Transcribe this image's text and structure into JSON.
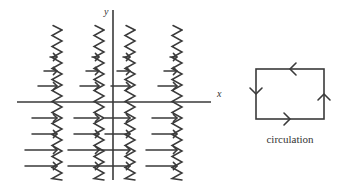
{
  "figure": {
    "title": "",
    "background_color": "#ffffff",
    "stroke_color": "#3a3a3a",
    "text_color": "#333333"
  },
  "axes": {
    "x_label": "x",
    "y_label": "y",
    "x_axis": {
      "x1": 17,
      "y1": 102,
      "x2": 211,
      "y2": 102
    },
    "y_axis": {
      "x1": 113,
      "y1": 10,
      "x2": 113,
      "y2": 180
    },
    "x_label_pos": {
      "x": 217,
      "y": 97
    },
    "y_label_pos": {
      "x": 104,
      "y": 15
    }
  },
  "wave_field": {
    "description": "vertical wavy (zigzag) magnetic field lines crossed by horizontal arrow lines",
    "wave_amplitude": 5,
    "wave_period": 11,
    "wave_lines": [
      {
        "x": 57,
        "y_top": 30,
        "y_bottom": 180
      },
      {
        "x": 99,
        "y_top": 30,
        "y_bottom": 180
      },
      {
        "x": 130,
        "y_top": 30,
        "y_bottom": 180
      },
      {
        "x": 177,
        "y_top": 30,
        "y_bottom": 180
      }
    ],
    "arrow_rows_upper": [
      {
        "y": 57,
        "segments": [
          {
            "x1": 50,
            "x2": 57
          },
          {
            "x1": 92,
            "x2": 99
          },
          {
            "x1": 123,
            "x2": 130
          },
          {
            "x1": 170,
            "x2": 177
          }
        ]
      },
      {
        "y": 71,
        "segments": [
          {
            "x1": 44,
            "x2": 57
          },
          {
            "x1": 86,
            "x2": 99
          },
          {
            "x1": 117,
            "x2": 130
          },
          {
            "x1": 164,
            "x2": 177
          }
        ]
      },
      {
        "y": 86,
        "segments": [
          {
            "x1": 38,
            "x2": 57
          },
          {
            "x1": 80,
            "x2": 99
          },
          {
            "x1": 111,
            "x2": 130
          },
          {
            "x1": 158,
            "x2": 177
          }
        ]
      }
    ],
    "arrow_rows_lower": [
      {
        "y": 118,
        "segments": [
          {
            "x1": 32,
            "x2": 57
          },
          {
            "x1": 74,
            "x2": 99
          },
          {
            "x1": 105,
            "x2": 130
          },
          {
            "x1": 152,
            "x2": 177
          }
        ]
      },
      {
        "y": 134,
        "segments": [
          {
            "x1": 32,
            "x2": 57
          },
          {
            "x1": 74,
            "x2": 99
          },
          {
            "x1": 105,
            "x2": 130
          },
          {
            "x1": 152,
            "x2": 177
          }
        ]
      },
      {
        "y": 150,
        "segments": [
          {
            "x1": 25,
            "x2": 57
          },
          {
            "x1": 68,
            "x2": 99
          },
          {
            "x1": 99,
            "x2": 130
          },
          {
            "x1": 146,
            "x2": 177
          }
        ]
      },
      {
        "y": 166,
        "segments": [
          {
            "x1": 25,
            "x2": 57
          },
          {
            "x1": 68,
            "x2": 99
          },
          {
            "x1": 99,
            "x2": 130
          },
          {
            "x1": 146,
            "x2": 177
          }
        ]
      }
    ],
    "arrow_direction": "right"
  },
  "circulation": {
    "label": "circulation",
    "label_pos": {
      "x": 290,
      "y": 143
    },
    "box": {
      "x": 256,
      "y": 69,
      "width": 68,
      "height": 50
    },
    "arrows": [
      {
        "side": "top",
        "direction": "left",
        "x": 290,
        "y": 69
      },
      {
        "side": "left",
        "direction": "down",
        "x": 256,
        "y": 94
      },
      {
        "side": "bottom",
        "direction": "right",
        "x": 290,
        "y": 119
      },
      {
        "side": "right",
        "direction": "up",
        "x": 324,
        "y": 94
      }
    ]
  }
}
